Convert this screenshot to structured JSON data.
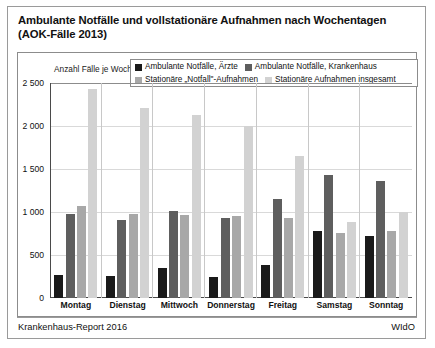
{
  "title": "Ambulante Notfälle und vollstationäre Aufnahmen nach Wochentagen (AOK-Fälle 2013)",
  "footer": {
    "left": "Krankenhaus-Report 2016",
    "right": "WIdO"
  },
  "chart_data": {
    "type": "bar",
    "title": "Ambulante Notfälle und vollstationäre Aufnahmen nach Wochentagen (AOK-Fälle 2013)",
    "xlabel": "",
    "ylabel": "Anzahl Fälle je Wochentag",
    "ylim": [
      0,
      2500
    ],
    "yticks": [
      0,
      500,
      1000,
      1500,
      2000,
      2500
    ],
    "ytick_labels": [
      "0",
      "500",
      "1 000",
      "1 500",
      "2 000",
      "2 500"
    ],
    "grid": true,
    "legend_position": "top",
    "categories": [
      "Montag",
      "Dienstag",
      "Mittwoch",
      "Donnerstag",
      "Freitag",
      "Samstag",
      "Sonntag"
    ],
    "series": [
      {
        "name": "Ambulante Notfälle, Ärzte",
        "color": "#1a1a1a",
        "values": [
          270,
          260,
          345,
          250,
          385,
          775,
          720
        ]
      },
      {
        "name": "Ambulante Notfälle, Krankenhaus",
        "color": "#5e5e5e",
        "values": [
          975,
          910,
          1010,
          930,
          1150,
          1425,
          1355
        ]
      },
      {
        "name": "Stationäre „Notfall\"-Aufnahmen",
        "color": "#a8a8a8",
        "values": [
          1070,
          975,
          965,
          955,
          935,
          755,
          775
        ]
      },
      {
        "name": "Stationäre Aufnahmen insgesamt",
        "color": "#d2d2d2",
        "values": [
          2430,
          2215,
          2130,
          2000,
          1650,
          880,
          995
        ]
      }
    ]
  }
}
